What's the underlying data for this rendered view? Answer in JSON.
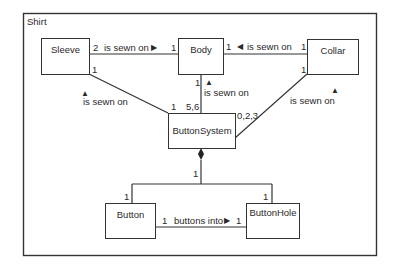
{
  "diagram": {
    "frame_title": "Shirt",
    "classes": {
      "sleeve": "Sleeve",
      "body": "Body",
      "collar": "Collar",
      "button_system": "ButtonSystem",
      "button": "Button",
      "button_hole": "ButtonHole"
    },
    "associations": {
      "sleeve_body": {
        "label": "is sewn on",
        "arrow": "▶",
        "mult_sleeve": "2",
        "mult_body": "1"
      },
      "collar_body": {
        "label": "is sewn on",
        "arrow": "◀",
        "mult_body": "1",
        "mult_collar": "1"
      },
      "body_buttonsystem": {
        "label": "is sewn on",
        "arrow": "▲",
        "mult_body": "1",
        "mult_bs": "5,6"
      },
      "sleeve_buttonsystem": {
        "label": "is sewn on",
        "arrow": "▲",
        "mult_sleeve": "1",
        "mult_bs": "1"
      },
      "collar_buttonsystem": {
        "label": "is sewn on",
        "arrow": "▲",
        "mult_collar": "1",
        "mult_bs": "0,2,3"
      },
      "composition": {
        "mult_bs": "1",
        "mult_button": "1",
        "mult_buttonhole": "1"
      },
      "button_buttonhole": {
        "label": "buttons into",
        "arrow": "▶",
        "mult_button": "1",
        "mult_buttonhole": "1"
      }
    }
  }
}
